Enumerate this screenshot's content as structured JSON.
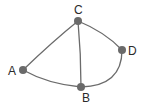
{
  "diagram": {
    "type": "graph",
    "nodes": [
      {
        "id": "A",
        "label": "A",
        "x": 23,
        "y": 70
      },
      {
        "id": "B",
        "label": "B",
        "x": 81,
        "y": 87
      },
      {
        "id": "C",
        "label": "C",
        "x": 78,
        "y": 21
      },
      {
        "id": "D",
        "label": "D",
        "x": 122,
        "y": 50
      }
    ],
    "edges": [
      {
        "from": "A",
        "to": "C"
      },
      {
        "from": "A",
        "to": "B"
      },
      {
        "from": "C",
        "to": "B"
      },
      {
        "from": "C",
        "to": "D"
      },
      {
        "from": "D",
        "to": "B"
      }
    ],
    "colors": {
      "edge": "#6b6b6b",
      "node": "#6a6a6a",
      "label": "#2a2a2a",
      "background": "#ffffff"
    }
  }
}
